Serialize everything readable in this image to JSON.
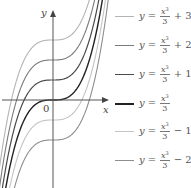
{
  "chart_data": {
    "type": "line",
    "title": "",
    "xlabel": "x",
    "ylabel": "y",
    "origin_label": "0",
    "xlim": [
      -2.65,
      2.85
    ],
    "ylim": [
      -4.4,
      5.0
    ],
    "grid": false,
    "legend_position": "right",
    "function": "y = x^3/3 + c",
    "series": [
      {
        "name": "y = x³/3 + 3",
        "c": 3,
        "color": "#b4b4b4",
        "width": 1.1
      },
      {
        "name": "y = x³/3 + 2",
        "c": 2,
        "color": "#7a7a7a",
        "width": 1.1
      },
      {
        "name": "y = x³/3 + 1",
        "c": 1,
        "color": "#4a4a4a",
        "width": 1.2
      },
      {
        "name": "y = x³/3",
        "c": 0,
        "color": "#222222",
        "width": 1.4
      },
      {
        "name": "y = x³/3 − 1",
        "c": -1,
        "color": "#c4c4c4",
        "width": 1.1
      },
      {
        "name": "y = x³/3 − 2",
        "c": -2,
        "color": "#8e8e8e",
        "width": 1.1
      }
    ]
  },
  "legend": [
    {
      "lhs": "y",
      "num": "x",
      "exp": "3",
      "den": "3",
      "const": "+ 3",
      "color": "#b4b4b4"
    },
    {
      "lhs": "y",
      "num": "x",
      "exp": "3",
      "den": "3",
      "const": "+ 2",
      "color": "#7a7a7a"
    },
    {
      "lhs": "y",
      "num": "x",
      "exp": "3",
      "den": "3",
      "const": "+ 1",
      "color": "#4a4a4a"
    },
    {
      "lhs": "y",
      "num": "x",
      "exp": "3",
      "den": "3",
      "const": "",
      "color": "#222222"
    },
    {
      "lhs": "y",
      "num": "x",
      "exp": "3",
      "den": "3",
      "const": "− 1",
      "color": "#c4c4c4"
    },
    {
      "lhs": "y",
      "num": "x",
      "exp": "3",
      "den": "3",
      "const": "− 2",
      "color": "#8e8e8e"
    }
  ]
}
